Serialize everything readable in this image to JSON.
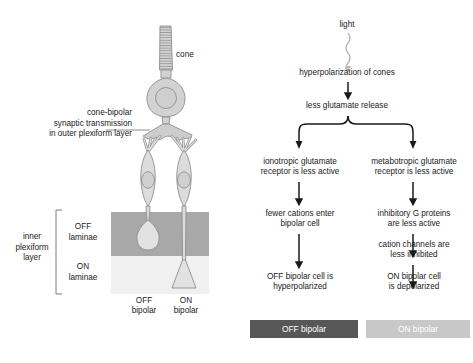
{
  "diagram": {
    "colors": {
      "cell_fill": "#dcdcdc",
      "cell_stroke": "#8a8a8a",
      "off_laminae_band": "#a8a8a8",
      "on_laminae_band": "#f0f0f0",
      "off_bar": "#575757",
      "on_bar": "#c8c8c8",
      "arrow": "#1a1a1a",
      "light_wave": "#bdbdbd",
      "leader_line": "#6e6e6e",
      "bar_text": "#ffffff"
    }
  },
  "anatomy": {
    "cone_label": "cone",
    "synapse_label": "cone-bipolar\nsynaptic transmission\nin outer plexiform layer",
    "inner_plexiform_label": "inner\nplexiform\nlayer",
    "off_laminae_label": "OFF\nlaminae",
    "on_laminae_label": "ON\nlaminae",
    "off_bipolar_label": "OFF\nbipolar",
    "on_bipolar_label": "ON\nbipolar"
  },
  "flow": {
    "light": "light",
    "hyperpolarization": "hyperpolarization of cones",
    "less_glutamate": "less glutamate release",
    "off_branch": {
      "step1": "ionotropic glutamate\nreceptor is less active",
      "step2": "fewer cations enter\nbipolar cell",
      "step3": "OFF bipolar cell is\nhyperpolarized",
      "result_bar": "OFF bipolar"
    },
    "on_branch": {
      "step1": "metabotropic glutamate\nreceptor is less active",
      "step2": "inhibitory G proteins\nare less active",
      "step3": "cation channels are\nless inhibited",
      "step4": "ON bipolar cell\nis depolarized",
      "result_bar": "ON bipolar"
    }
  }
}
